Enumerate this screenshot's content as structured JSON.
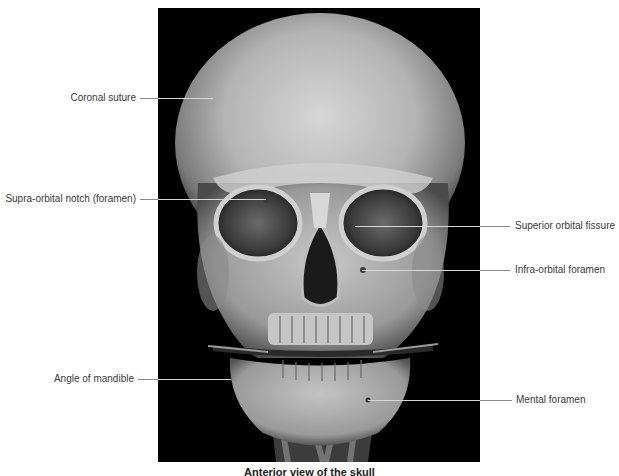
{
  "figure": {
    "alt": "CT 3D volume rendering, anterior view of the skull",
    "background": "#000000"
  },
  "labels": {
    "coronal_suture": "Coronal suture",
    "supra_orbital_notch": "Supra-orbital notch (foramen)",
    "superior_orbital_fissure": "Superior orbital fissure",
    "infra_orbital_foramen": "Infra-orbital foramen",
    "angle_of_mandible": "Angle of mandible",
    "mental_foramen": "Mental foramen"
  },
  "caption": "Anterior view of the skull",
  "colors": {
    "leader_line": "#8a8a8a",
    "label_text": "#3a3a3a"
  }
}
